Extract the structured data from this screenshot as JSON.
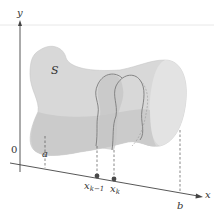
{
  "figure": {
    "labels": {
      "y_axis": "y",
      "x_axis": "x",
      "origin": "0",
      "solid": "S",
      "a": "a",
      "b": "b",
      "xk_minus_1_base": "x",
      "xk_minus_1_sub": "k−1",
      "xk_base": "x",
      "xk_sub": "k"
    },
    "colors": {
      "solid_fill": "#d6d6d6",
      "solid_shade": "#bdbdbd",
      "solid_light": "#e6e6e6",
      "axis": "#444444",
      "slab_outline": "#7a7a7a",
      "point": "#4a4a4a"
    },
    "points": {
      "a": [
        45,
        158
      ],
      "xk_minus_1": [
        97,
        166
      ],
      "xk": [
        114,
        170
      ],
      "b": [
        180,
        192
      ]
    }
  }
}
